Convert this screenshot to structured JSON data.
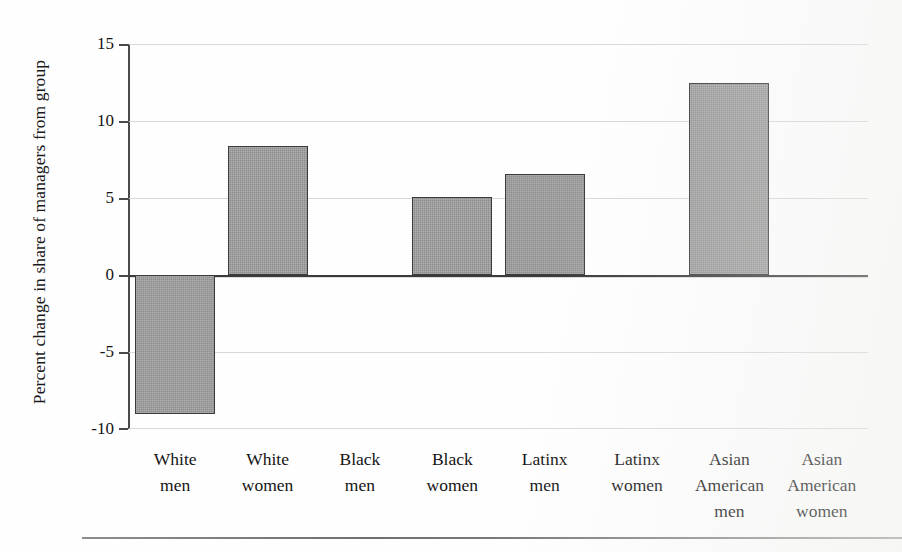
{
  "figure": {
    "kind": "bar-chart-figure",
    "background_color": "#fefefe"
  },
  "axes": {
    "y_axis_title": "Percent change in share of managers from group",
    "y_tick_labels": [
      "15",
      "10",
      "5",
      "0",
      "-5",
      "-10"
    ],
    "y_tick_values": [
      15,
      10,
      5,
      0,
      -5,
      -10
    ],
    "x_tick_labels": [
      [
        "White",
        "men"
      ],
      [
        "White",
        "women"
      ],
      [
        "Black",
        "men"
      ],
      [
        "Black",
        "women"
      ],
      [
        "Latinx",
        "men"
      ],
      [
        "Latinx",
        "women"
      ],
      [
        "Asian",
        "American",
        "men"
      ],
      [
        "Asian",
        "American",
        "women"
      ]
    ]
  },
  "style": {
    "bar_fill": "#9a9a9a",
    "bar_stroke": "#3b3b3b",
    "gridline_color": "#d8d8d8",
    "zero_line_color": "#3a3a3a",
    "axis_color": "#4a4a4a",
    "text_color": "#141414"
  },
  "chart_data": {
    "type": "bar",
    "title": "",
    "xlabel": "",
    "ylabel": "Percent change in share of managers from group",
    "categories": [
      "White men",
      "White women",
      "Black men",
      "Black women",
      "Latinx men",
      "Latinx women",
      "Asian American men",
      "Asian American women"
    ],
    "values": [
      -9.0,
      8.4,
      0,
      5.05,
      6.55,
      0,
      12.5,
      0
    ],
    "ylim": [
      -10,
      15
    ],
    "yticks": [
      -10,
      -5,
      0,
      5,
      10,
      15
    ],
    "grid": true,
    "legend": false
  }
}
